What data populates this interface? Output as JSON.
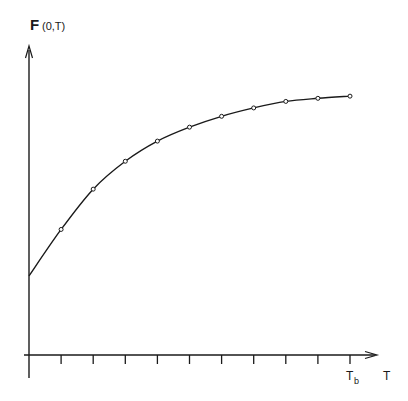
{
  "chart_data": {
    "type": "line",
    "title": "",
    "ylabel_main": "F",
    "ylabel_sub": "(0,T)",
    "xlabel": "T",
    "x_tick_special_label": "T",
    "x_tick_special_sub": "b",
    "grid": false,
    "legend": null,
    "num_x_ticks": 10,
    "x": [
      0,
      1,
      2,
      3,
      4,
      5,
      6,
      7,
      8,
      9,
      10
    ],
    "series": [
      {
        "name": "F(0,T)",
        "style": "smooth curve with circular markers",
        "values": [
          0.255,
          0.405,
          0.535,
          0.625,
          0.69,
          0.735,
          0.77,
          0.797,
          0.818,
          0.828,
          0.835
        ],
        "markers_at": [
          1,
          2,
          3,
          4,
          5,
          6,
          7,
          8,
          9,
          10
        ]
      }
    ],
    "ylim": [
      0,
      1
    ],
    "xlim": [
      0,
      10.8
    ]
  },
  "colors": {
    "line": "#1a1a1a",
    "background": "#ffffff"
  }
}
